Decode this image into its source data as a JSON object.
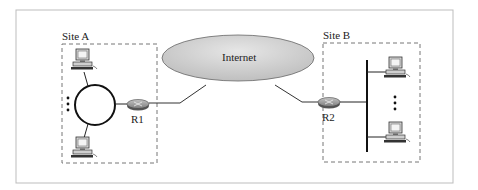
{
  "diagram": {
    "internet_label": "Internet",
    "site_a": {
      "label": "Site A",
      "router": "R1",
      "topology": "ring",
      "hosts_shown": 2,
      "ellipsis": "⋮"
    },
    "site_b": {
      "label": "Site B",
      "router": "R2",
      "topology": "bus",
      "hosts_shown": 2,
      "ellipsis": "⋮"
    },
    "colors": {
      "frame": "#bdbdbd",
      "line": "#222222",
      "cloud_fill": "#d4d4d4",
      "router_fill": "#9a9a9a",
      "dashed": "#777777"
    }
  }
}
